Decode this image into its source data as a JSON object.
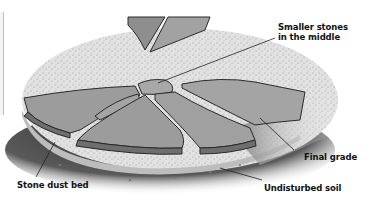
{
  "diagram": {
    "labels": {
      "smaller_stones_line1": "Smaller stones",
      "smaller_stones_line2": "in the middle",
      "final_grade": "Final grade",
      "stone_dust_bed": "Stone dust bed",
      "undisturbed_soil": "Undisturbed soil"
    },
    "colors": {
      "stone": "#9a9a9a",
      "stone_edge": "#6e6e6e",
      "outline": "#2a2a2a",
      "stone_dust": "#d8d8d8",
      "soil": "#4a4a4a",
      "grass": "#8c8c8c",
      "background": "#ffffff"
    }
  }
}
